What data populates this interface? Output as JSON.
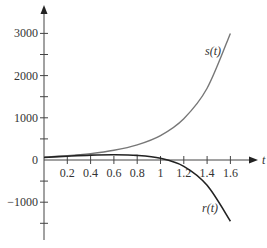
{
  "chart_data": {
    "type": "line",
    "title": "",
    "xlabel": "t",
    "ylabel": "",
    "xlim": [
      0,
      1.7
    ],
    "ylim": [
      -1750,
      3400
    ],
    "grid": false,
    "legend": "inline labels",
    "x_ticks": [
      "0.2",
      "0.4",
      "0.6",
      "0.8",
      "1",
      "1.2",
      "1.4",
      "1.6"
    ],
    "y_ticks": [
      "3000",
      "2000",
      "1000",
      "0",
      "−1000"
    ],
    "x": [
      0,
      0.2,
      0.4,
      0.6,
      0.8,
      1.0,
      1.2,
      1.4,
      1.6
    ],
    "series": [
      {
        "name": "s(t)",
        "color": "#777777",
        "values": [
          70,
          100,
          150,
          230,
          360,
          580,
          980,
          1700,
          3000
        ]
      },
      {
        "name": "r(t)",
        "color": "#222222",
        "values": [
          60,
          90,
          115,
          125,
          110,
          40,
          -150,
          -600,
          -1450
        ]
      }
    ],
    "annotations": [
      {
        "text": "s(t)",
        "near": "end of upper curve"
      },
      {
        "text": "r(t)",
        "near": "end of lower curve"
      }
    ]
  }
}
